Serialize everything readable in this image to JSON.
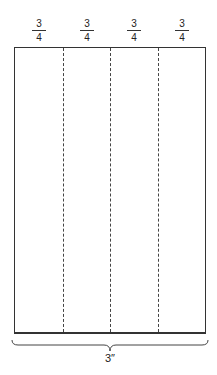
{
  "diagram": {
    "segments": [
      {
        "numerator": "3",
        "denominator": "4"
      },
      {
        "numerator": "3",
        "denominator": "4"
      },
      {
        "numerator": "3",
        "denominator": "4"
      },
      {
        "numerator": "3",
        "denominator": "4"
      }
    ],
    "total_width_label": "3″",
    "divider_style": "dashed",
    "line_color": "#333333"
  }
}
